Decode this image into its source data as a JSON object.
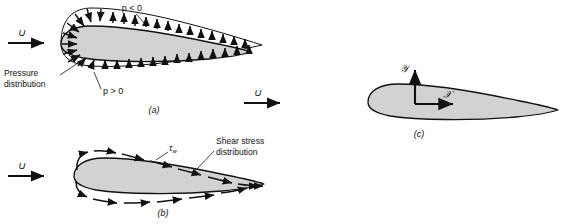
{
  "figure": {
    "background_color": "#ffffff",
    "line_color": "#111111",
    "airfoil_fill": "#d2d2d2",
    "airfoil_stroke": "#111111"
  },
  "panels": [
    {
      "id": "a",
      "caption": "(a)",
      "title_concept": "pressure-distribution",
      "freestream_label": "U",
      "annotations": [
        {
          "name": "pressure-distribution-label",
          "text_line1": "Pressure",
          "text_line2": "distribution"
        },
        {
          "name": "p-negative-label",
          "text": "p < 0"
        },
        {
          "name": "p-positive-label",
          "text": "p > 0"
        }
      ]
    },
    {
      "id": "b",
      "caption": "(b)",
      "title_concept": "shear-stress-distribution",
      "freestream_label": "U",
      "annotations": [
        {
          "name": "tau-wall-label",
          "text": "τ",
          "subscript": "w"
        },
        {
          "name": "shear-stress-distribution-label",
          "text_line1": "Shear stress",
          "text_line2": "distribution"
        }
      ]
    },
    {
      "id": "c",
      "caption": "(c)",
      "title_concept": "coordinate-axes",
      "freestream_label": "U",
      "annotations": [
        {
          "name": "y-axis-label",
          "text": "𝒴"
        },
        {
          "name": "x-axis-label",
          "text": "𝒳"
        }
      ]
    }
  ]
}
